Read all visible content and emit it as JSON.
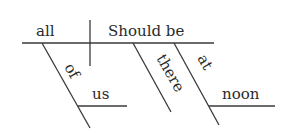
{
  "diagram": {
    "type": "sentence-diagram",
    "subject": "all",
    "predicate": "Should be",
    "modifiers": [
      {
        "word": "of",
        "role": "preposition",
        "modifies": "all",
        "object": "us"
      },
      {
        "word": "there",
        "role": "adverb",
        "modifies": "Should be"
      },
      {
        "word": "at",
        "role": "preposition",
        "modifies": "Should be",
        "object": "noon"
      }
    ],
    "labels": {
      "subject": "all",
      "predicate": "Should be",
      "of": "of",
      "us": "us",
      "there": "there",
      "at": "at",
      "noon": "noon"
    },
    "line_color": "#3a3a3a",
    "text_color": "#2a2a2a"
  }
}
